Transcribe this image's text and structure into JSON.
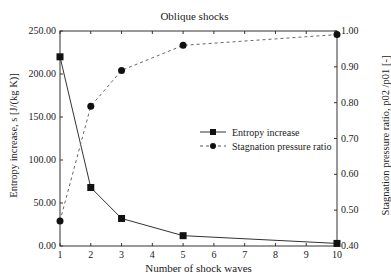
{
  "chart_data": {
    "type": "line",
    "title": "Oblique shocks",
    "xlabel": "Number of shock waves",
    "ylabel": "Entropy increase, s [J/(kg K)]",
    "y2label": "Stagnation pressure ratio, p02 /p01 [-]",
    "x": [
      1,
      2,
      3,
      5,
      10
    ],
    "xticks": [
      "1",
      "2",
      "3",
      "4",
      "5",
      "6",
      "7",
      "8",
      "9",
      "10"
    ],
    "xlim": [
      1,
      10
    ],
    "ylim": [
      0,
      250
    ],
    "yticks": [
      "0.00",
      "50.00",
      "100.00",
      "150.00",
      "200.00",
      "250.00"
    ],
    "y2lim": [
      0.4,
      1.0
    ],
    "y2ticks": [
      "0.40",
      "0.50",
      "0.60",
      "0.70",
      "0.80",
      "0.90",
      "1.00"
    ],
    "grid": false,
    "legend_position": "center-right inside plot",
    "series": [
      {
        "name": "Entropy increase",
        "axis": "left",
        "marker": "square",
        "line": "solid",
        "values": [
          220,
          68,
          32,
          12,
          3
        ]
      },
      {
        "name": "Stagnation pressure ratio",
        "axis": "right",
        "marker": "circle",
        "line": "dashed",
        "values": [
          0.47,
          0.79,
          0.89,
          0.96,
          0.99
        ]
      }
    ]
  },
  "labels": {
    "title": "Oblique shocks",
    "xlabel": "Number of shock waves",
    "ylabel_left": "Entropy increase, s [J/(kg K)]",
    "ylabel_right": "Stagnation pressure ratio, p02 /p01 [-]",
    "legend_entropy": "Entropy increase",
    "legend_pressure": "Stagnation pressure ratio"
  }
}
